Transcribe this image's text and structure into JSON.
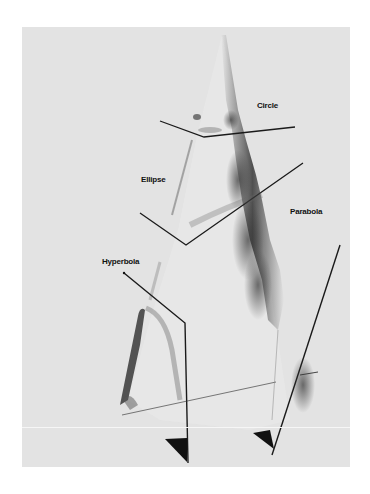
{
  "figure": {
    "labels": {
      "circle": "Circle",
      "ellipse": "Ellipse",
      "parabola": "Parabola",
      "hyperbola": "Hyperbola"
    },
    "colors": {
      "page_background": "#ffffff",
      "photo_background": "#e3e3e3",
      "ink": "#111111"
    }
  }
}
